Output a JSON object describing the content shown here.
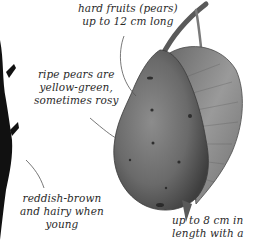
{
  "illustration": {
    "subject": "pear",
    "elements": [
      "pear-fruit",
      "pear-leaf",
      "pear-stalk",
      "twig"
    ]
  },
  "annotations": {
    "fruit_size": {
      "lines": [
        "hard fruits (pears)",
        "up to 12 cm long"
      ]
    },
    "fruit_color": {
      "lines": [
        "ripe pears are",
        "yellow-green,",
        "sometimes rosy"
      ]
    },
    "twig": {
      "lines": [
        "reddish-brown",
        "and hairy when",
        "young"
      ]
    },
    "leaf": {
      "lines": [
        "up to 8 cm in",
        "length with a"
      ]
    }
  },
  "colors": {
    "background": "#ffffff",
    "text": "#2a2a2a",
    "leader_line": "#555555",
    "fruit": "#6e6e6e",
    "leaf": "#8a8a8a",
    "twig": "#111111"
  }
}
